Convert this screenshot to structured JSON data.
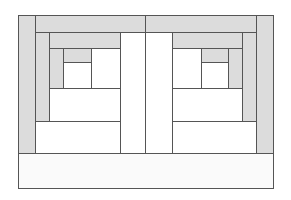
{
  "diagram": {
    "title": "",
    "type": "log-cabin quilt block layout",
    "colors": {
      "shaded": "#dcdcdc",
      "plain": "#ffffff",
      "line": "#555555",
      "base": "#fafafa"
    },
    "pieces": [
      {
        "id": "L-outer-left",
        "x": 18,
        "y": 15,
        "w": 18,
        "h": 139,
        "fill": "shaded"
      },
      {
        "id": "top-left",
        "x": 35,
        "y": 15,
        "w": 111,
        "h": 18,
        "fill": "shaded"
      },
      {
        "id": "top-right",
        "x": 145,
        "y": 15,
        "w": 112,
        "h": 18,
        "fill": "shaded"
      },
      {
        "id": "R-outer-right",
        "x": 256,
        "y": 15,
        "w": 18,
        "h": 139,
        "fill": "shaded"
      },
      {
        "id": "L-strip2-left",
        "x": 35,
        "y": 32,
        "w": 15,
        "h": 90,
        "fill": "shaded"
      },
      {
        "id": "L-strip2-top",
        "x": 49,
        "y": 32,
        "w": 72,
        "h": 17,
        "fill": "shaded"
      },
      {
        "id": "L-strip3-left",
        "x": 49,
        "y": 48,
        "w": 15,
        "h": 41,
        "fill": "shaded"
      },
      {
        "id": "L-center-top",
        "x": 63,
        "y": 48,
        "w": 29,
        "h": 15,
        "fill": "shaded"
      },
      {
        "id": "L-center",
        "x": 63,
        "y": 62,
        "w": 29,
        "h": 27,
        "fill": "plain"
      },
      {
        "id": "L-right-col",
        "x": 91,
        "y": 48,
        "w": 30,
        "h": 41,
        "fill": "plain"
      },
      {
        "id": "L-bottom-1",
        "x": 49,
        "y": 88,
        "w": 72,
        "h": 34,
        "fill": "plain"
      },
      {
        "id": "L-bottom-2",
        "x": 35,
        "y": 121,
        "w": 86,
        "h": 33,
        "fill": "plain"
      },
      {
        "id": "mid-left",
        "x": 120,
        "y": 32,
        "w": 26,
        "h": 122,
        "fill": "plain"
      },
      {
        "id": "mid-right",
        "x": 145,
        "y": 32,
        "w": 28,
        "h": 122,
        "fill": "plain"
      },
      {
        "id": "R-strip2-right",
        "x": 242,
        "y": 32,
        "w": 15,
        "h": 90,
        "fill": "shaded"
      },
      {
        "id": "R-strip2-top",
        "x": 172,
        "y": 32,
        "w": 71,
        "h": 17,
        "fill": "shaded"
      },
      {
        "id": "R-strip3-right",
        "x": 228,
        "y": 48,
        "w": 15,
        "h": 41,
        "fill": "shaded"
      },
      {
        "id": "R-center-top",
        "x": 201,
        "y": 48,
        "w": 28,
        "h": 15,
        "fill": "shaded"
      },
      {
        "id": "R-center",
        "x": 201,
        "y": 62,
        "w": 28,
        "h": 27,
        "fill": "plain"
      },
      {
        "id": "R-left-col",
        "x": 172,
        "y": 48,
        "w": 30,
        "h": 41,
        "fill": "plain"
      },
      {
        "id": "R-bottom-1",
        "x": 172,
        "y": 88,
        "w": 71,
        "h": 34,
        "fill": "plain"
      },
      {
        "id": "R-bottom-2",
        "x": 172,
        "y": 121,
        "w": 85,
        "h": 33,
        "fill": "plain"
      },
      {
        "id": "base-bar",
        "x": 18,
        "y": 153,
        "w": 256,
        "h": 36,
        "fill": "base"
      }
    ]
  }
}
